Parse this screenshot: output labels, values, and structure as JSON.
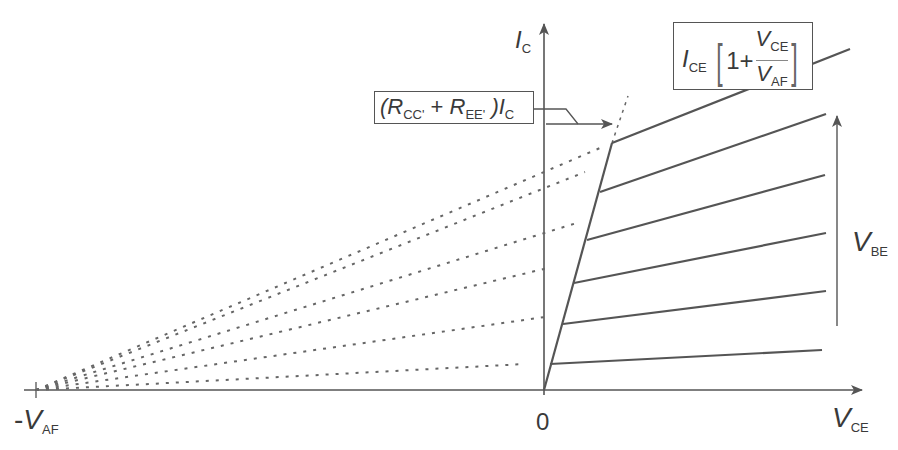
{
  "diagram": {
    "axes": {
      "y_label": {
        "main": "I",
        "sub": "C"
      },
      "x_label": {
        "main": "V",
        "sub": "CE"
      },
      "origin_label": "0",
      "neg_label": {
        "prefix": "-",
        "main": "V",
        "sub": "AF"
      }
    },
    "annotations": {
      "saturation_box": {
        "open_paren": "(",
        "r1_main": "R",
        "r1_sub": "CC'",
        "plus": " + ",
        "r2_main": "R",
        "r2_sub": "EE'",
        "close_paren": " )",
        "i_main": "I",
        "i_sub": "C"
      },
      "early_box": {
        "i_main": "I",
        "i_sub": "CE",
        "one_plus": "1+",
        "num_main": "V",
        "num_sub": "CE",
        "den_main": "V",
        "den_sub": "AF"
      },
      "vbe_arrow": {
        "main": "V",
        "sub": "BE"
      }
    },
    "colors": {
      "line": "#555555",
      "axis": "#555555",
      "dotted": "#666666",
      "text": "#3a3a3a"
    },
    "curves": [
      {
        "knee": [
          550,
          364
        ],
        "end": [
          822,
          350
        ]
      },
      {
        "knee": [
          563,
          324
        ],
        "end": [
          826,
          291
        ]
      },
      {
        "knee": [
          574,
          283
        ],
        "end": [
          826,
          233
        ]
      },
      {
        "knee": [
          587,
          240
        ],
        "end": [
          825,
          175
        ]
      },
      {
        "knee": [
          600,
          192
        ],
        "end": [
          826,
          114
        ]
      },
      {
        "knee": [
          612,
          143
        ],
        "end": [
          850,
          49
        ]
      }
    ],
    "origin": [
      544,
      390
    ],
    "neg_vaf": [
      36,
      390
    ]
  }
}
